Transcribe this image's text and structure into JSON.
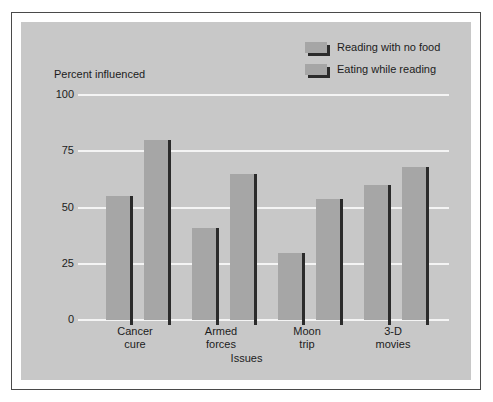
{
  "chart_data": {
    "type": "bar",
    "title": "",
    "xlabel": "Issues",
    "ylabel": "Percent influenced",
    "categories": [
      "Cancer cure",
      "Armed forces",
      "Moon trip",
      "3-D movies"
    ],
    "category_lines": [
      [
        "Cancer",
        "cure"
      ],
      [
        "Armed",
        "forces"
      ],
      [
        "Moon",
        "trip"
      ],
      [
        "3-D",
        "movies"
      ]
    ],
    "series": [
      {
        "name": "Reading with no food",
        "values": [
          55,
          41,
          30,
          60
        ]
      },
      {
        "name": "Eating while reading",
        "values": [
          80,
          65,
          54,
          68
        ]
      }
    ],
    "yticks": [
      0,
      25,
      50,
      75,
      100
    ],
    "ytick_labels": [
      "0",
      "25",
      "50",
      "75",
      "100"
    ],
    "ylim": [
      0,
      100
    ],
    "grid": true,
    "legend_position": "top-right",
    "colors": {
      "bar_face": "#a6a6a6",
      "bar_shadow": "#2b2b2b",
      "panel_background": "#c8c8c8",
      "gridline": "#f4f4f4",
      "frame_border": "#4a4a4a",
      "text": "#1c1c1c"
    }
  },
  "legend": {
    "items": [
      {
        "label": "Reading with no food"
      },
      {
        "label": "Eating while reading"
      }
    ]
  }
}
